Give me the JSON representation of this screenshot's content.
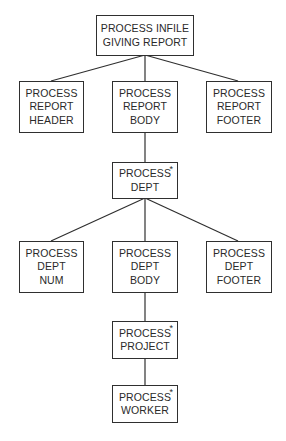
{
  "diagram": {
    "type": "structure-chart",
    "iteration_marker": "*",
    "nodes": {
      "root": {
        "lines": [
          "PROCESS INFILE",
          "GIVING REPORT"
        ],
        "iterative": false
      },
      "rpt_header": {
        "lines": [
          "PROCESS",
          "REPORT",
          "HEADER"
        ],
        "iterative": false
      },
      "rpt_body": {
        "lines": [
          "PROCESS",
          "REPORT",
          "BODY"
        ],
        "iterative": false
      },
      "rpt_footer": {
        "lines": [
          "PROCESS",
          "REPORT",
          "FOOTER"
        ],
        "iterative": false
      },
      "dept": {
        "lines": [
          "PROCESS",
          "DEPT"
        ],
        "iterative": true
      },
      "dept_num": {
        "lines": [
          "PROCESS",
          "DEPT",
          "NUM"
        ],
        "iterative": false
      },
      "dept_body": {
        "lines": [
          "PROCESS",
          "DEPT",
          "BODY"
        ],
        "iterative": false
      },
      "dept_footer": {
        "lines": [
          "PROCESS",
          "DEPT",
          "FOOTER"
        ],
        "iterative": false
      },
      "project": {
        "lines": [
          "PROCESS",
          "PROJECT"
        ],
        "iterative": true
      },
      "worker": {
        "lines": [
          "PROCESS",
          "WORKER"
        ],
        "iterative": true
      }
    },
    "edges": [
      [
        "root",
        "rpt_header"
      ],
      [
        "root",
        "rpt_body"
      ],
      [
        "root",
        "rpt_footer"
      ],
      [
        "rpt_body",
        "dept"
      ],
      [
        "dept",
        "dept_num"
      ],
      [
        "dept",
        "dept_body"
      ],
      [
        "dept",
        "dept_footer"
      ],
      [
        "dept_body",
        "project"
      ],
      [
        "project",
        "worker"
      ]
    ]
  }
}
